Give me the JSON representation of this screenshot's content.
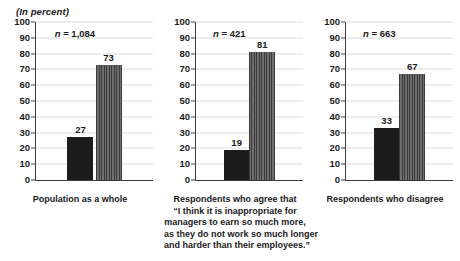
{
  "header": {
    "unit_note": "(In percent)"
  },
  "chart_data": {
    "type": "bar",
    "title": "",
    "subtitle": "(In percent)",
    "xlabel": "",
    "ylabel": "",
    "ylim": [
      0,
      100
    ],
    "yticks": [
      0,
      10,
      20,
      30,
      40,
      50,
      60,
      70,
      80,
      90,
      100
    ],
    "grid": true,
    "legend_position": "none",
    "panels": [
      {
        "caption_lines": [
          "Population as a whole"
        ],
        "caption": "Population as a whole",
        "sample_size_label": "n = 1,084",
        "sample_size_symbol": "n",
        "sample_size_value": "1,084",
        "categories": [
          "agree",
          "disagree"
        ],
        "values": [
          27,
          73
        ],
        "bar_styles": [
          "solid-dark",
          "striped-gray"
        ]
      },
      {
        "caption_lines": [
          "Respondents who agree that",
          "“I think it is inappropriate for",
          "managers to earn so much more,",
          "as they do not work so much longer",
          "and harder than their employees.”"
        ],
        "caption": "Respondents who agree that “I think it is inappropriate for managers to earn so much more, as they do not work so much longer and harder than their employees.”",
        "sample_size_label": "n = 421",
        "sample_size_symbol": "n",
        "sample_size_value": "421",
        "categories": [
          "agree",
          "disagree"
        ],
        "values": [
          19,
          81
        ],
        "bar_styles": [
          "solid-dark",
          "striped-gray"
        ]
      },
      {
        "caption_lines": [
          "Respondents who disagree"
        ],
        "caption": "Respondents who disagree",
        "sample_size_label": "n = 663",
        "sample_size_symbol": "n",
        "sample_size_value": "663",
        "categories": [
          "agree",
          "disagree"
        ],
        "values": [
          33,
          67
        ],
        "bar_styles": [
          "solid-dark",
          "striped-gray"
        ]
      }
    ],
    "colors": {
      "bar_solid": "#1c1c1c",
      "bar_striped": "#5f5f5f",
      "axis": "#3c3c3c",
      "grid": "#dcdcdc",
      "text": "#1a1a1a",
      "background": "#ffffff"
    }
  }
}
